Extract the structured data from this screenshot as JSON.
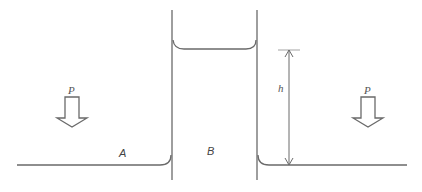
{
  "diagram": {
    "labels": {
      "pressure_left": "P",
      "pressure_right": "P",
      "region_a": "A",
      "region_b": "B",
      "height": "h"
    },
    "colors": {
      "line": "#666666",
      "text": "#555555",
      "background": "#ffffff"
    }
  }
}
